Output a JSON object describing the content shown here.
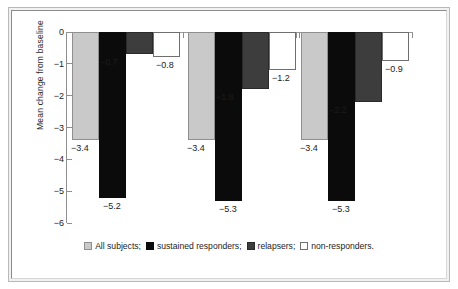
{
  "chart_data": {
    "type": "bar",
    "title": "",
    "subtitle": "",
    "xlabel": "",
    "ylabel": "Mean change from baseline",
    "ylim": [
      -6,
      0
    ],
    "yticks": [
      0,
      -1,
      -2,
      -3,
      -4,
      -5,
      -6
    ],
    "ytick_labels": [
      "0",
      "−1",
      "−2",
      "−3",
      "−4",
      "−5",
      "−6"
    ],
    "grid": false,
    "legend_position": "bottom",
    "categories": [
      "Group 1",
      "Group 2",
      "Group 3"
    ],
    "series": [
      {
        "name": "All subjects;",
        "key": "all-subjects",
        "color": "#c9c9c9",
        "edge_color": "#8f8f8f",
        "swatch": "sw-light",
        "values": [
          -3.4,
          -3.4,
          -3.4
        ],
        "labels": [
          "−3.4",
          "−3.4",
          "−3.4"
        ]
      },
      {
        "name": "sustained responders;",
        "key": "sustained-responders",
        "color": "#0b0b0b",
        "edge_color": "#0b0b0b",
        "swatch": "sw-black",
        "values": [
          -5.2,
          -5.3,
          -5.3
        ],
        "labels": [
          "−5.2",
          "−5.3",
          "−5.3"
        ]
      },
      {
        "name": "relapsers;",
        "key": "relapsers",
        "color": "#3d3d3d",
        "edge_color": "#2a2a2a",
        "swatch": "sw-dark",
        "values": [
          -0.7,
          -1.8,
          -2.2
        ],
        "labels": [
          "−0.7",
          "−1.8",
          "−2.2"
        ]
      },
      {
        "name": "non-responders.",
        "key": "non-responders",
        "color": "#ffffff",
        "edge_color": "#6f6f6f",
        "swatch": "sw-white",
        "values": [
          -0.8,
          -1.2,
          -0.9
        ],
        "labels": [
          "−0.8",
          "−1.2",
          "−0.9"
        ]
      }
    ]
  },
  "legend": {
    "items": [
      {
        "label": "All subjects;",
        "swatch": "sw-light"
      },
      {
        "label": "sustained responders;",
        "swatch": "sw-black"
      },
      {
        "label": "relapsers;",
        "swatch": "sw-dark"
      },
      {
        "label": "non-responders.",
        "swatch": "sw-white"
      }
    ]
  },
  "axis": {
    "y_title": "Mean change from baseline"
  }
}
